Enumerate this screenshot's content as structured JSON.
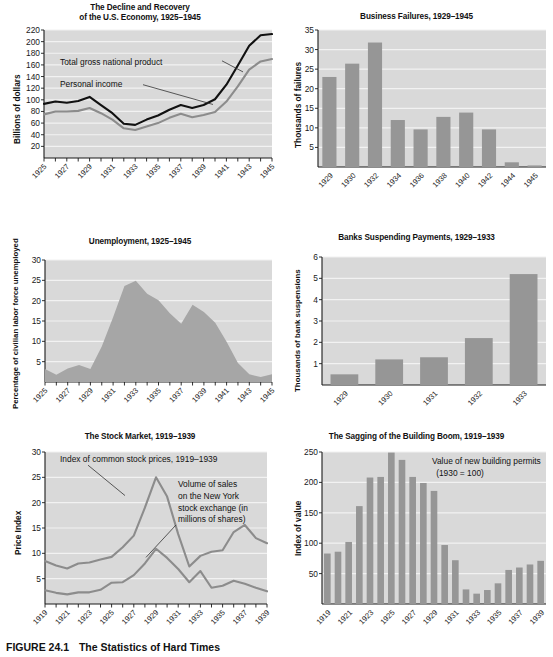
{
  "figure": {
    "caption_number": "FIGURE 24.1",
    "caption_title": "The Statistics of Hard Times"
  },
  "colors": {
    "plot_background": "#d9d9d9",
    "gridline": "#f2f2f2",
    "bar_fill": "#969696",
    "line_dark": "#111111",
    "line_gray": "#8c8c8c",
    "area_fill": "#a6a6a6",
    "axis": "#1a1a1a",
    "page_background": "#ffffff"
  },
  "chart_data": [
    {
      "id": "gnp",
      "type": "line",
      "title": "The Decline and Recovery\nof the U.S. Economy, 1925–1945",
      "title_lines": [
        "The Decline and Recovery",
        "of the U.S. Economy, 1925–1945"
      ],
      "xlabel": "",
      "ylabel": "Billions of dollars",
      "ylim": [
        0,
        220
      ],
      "yticks": [
        20,
        40,
        60,
        80,
        100,
        120,
        140,
        160,
        180,
        200,
        220
      ],
      "grid": true,
      "x": [
        1925,
        1926,
        1927,
        1928,
        1929,
        1930,
        1931,
        1932,
        1933,
        1934,
        1935,
        1936,
        1937,
        1938,
        1939,
        1940,
        1941,
        1942,
        1943,
        1944,
        1945
      ],
      "xticks": [
        1925,
        1927,
        1929,
        1931,
        1933,
        1935,
        1937,
        1939,
        1941,
        1943,
        1945
      ],
      "series": [
        {
          "name": "Total gross national product",
          "color": "#111111",
          "values": [
            93,
            97,
            95,
            98,
            105,
            91,
            77,
            59,
            57,
            66,
            73,
            83,
            91,
            86,
            91,
            101,
            126,
            159,
            193,
            211,
            213
          ]
        },
        {
          "name": "Personal income",
          "color": "#8c8c8c",
          "values": [
            75,
            80,
            80,
            81,
            86,
            77,
            66,
            51,
            48,
            54,
            60,
            69,
            76,
            70,
            74,
            79,
            97,
            123,
            152,
            166,
            170
          ]
        }
      ],
      "annotations": [
        {
          "text": "Total gross national product",
          "x": 1930.0,
          "y": 168
        },
        {
          "text": "Personal income",
          "x": 1930.0,
          "y": 130
        }
      ]
    },
    {
      "id": "business-failures",
      "type": "bar",
      "title": "Business Failures, 1929–1945",
      "title_lines": [
        "Business Failures, 1929–1945"
      ],
      "xlabel": "",
      "ylabel": "Thousands of failures",
      "ylim": [
        0,
        35
      ],
      "yticks": [
        5,
        10,
        15,
        20,
        25,
        30,
        35
      ],
      "grid": true,
      "categories": [
        "1929",
        "1930",
        "1932",
        "1934",
        "1936",
        "1938",
        "1940",
        "1942",
        "1944",
        "1945"
      ],
      "values": [
        23.0,
        26.4,
        31.8,
        12.0,
        9.6,
        12.8,
        13.9,
        9.6,
        1.2,
        0.4
      ]
    },
    {
      "id": "unemployment",
      "type": "area",
      "title": "Unemployment, 1925–1945",
      "title_lines": [
        "Unemployment, 1925–1945"
      ],
      "xlabel": "",
      "ylabel": "Percentage of civilian labor force unemployed",
      "ylim": [
        0,
        30
      ],
      "yticks": [
        5,
        10,
        15,
        20,
        25,
        30
      ],
      "grid": true,
      "x": [
        1925,
        1926,
        1927,
        1928,
        1929,
        1930,
        1931,
        1932,
        1933,
        1934,
        1935,
        1936,
        1937,
        1938,
        1939,
        1940,
        1941,
        1942,
        1943,
        1944,
        1945
      ],
      "xticks": [
        1925,
        1927,
        1929,
        1931,
        1933,
        1935,
        1937,
        1939,
        1941,
        1943,
        1945
      ],
      "values": [
        3.2,
        1.8,
        3.3,
        4.2,
        3.2,
        8.7,
        15.9,
        23.6,
        24.9,
        21.7,
        20.1,
        16.9,
        14.3,
        19.0,
        17.2,
        14.6,
        9.9,
        4.7,
        1.9,
        1.2,
        1.9
      ]
    },
    {
      "id": "bank-suspensions",
      "type": "bar",
      "title": "Banks Suspending Payments, 1929–1933",
      "title_lines": [
        "Banks Suspending Payments, 1929–1933"
      ],
      "xlabel": "",
      "ylabel": "Thousands of bank suspensions",
      "ylim": [
        0,
        6
      ],
      "yticks": [
        1,
        2,
        3,
        4,
        5,
        6
      ],
      "grid": true,
      "categories": [
        "1929",
        "1930",
        "1931",
        "1932",
        "1933"
      ],
      "values": [
        0.5,
        1.2,
        1.3,
        2.2,
        5.2
      ]
    },
    {
      "id": "stock-market",
      "type": "line",
      "title": "The Stock Market, 1919–1939",
      "title_lines": [
        "The Stock Market, 1919–1939"
      ],
      "xlabel": "",
      "ylabel": "Price Index",
      "ylim": [
        0,
        30
      ],
      "yticks": [
        5,
        10,
        15,
        20,
        25,
        30
      ],
      "grid": true,
      "x": [
        1919,
        1920,
        1921,
        1922,
        1923,
        1924,
        1925,
        1926,
        1927,
        1928,
        1929,
        1930,
        1931,
        1932,
        1933,
        1934,
        1935,
        1936,
        1937,
        1938,
        1939
      ],
      "xticks": [
        1919,
        1921,
        1923,
        1925,
        1927,
        1929,
        1931,
        1933,
        1935,
        1937,
        1939
      ],
      "series": [
        {
          "name": "Index of common stock prices, 1919–1939",
          "color": "#8c8c8c",
          "values": [
            8.5,
            7.6,
            7.0,
            8.0,
            8.2,
            8.8,
            9.3,
            11.2,
            13.5,
            19.0,
            25.0,
            21.2,
            13.8,
            7.4,
            9.5,
            10.3,
            10.6,
            14.2,
            15.6,
            13.0,
            12.0,
            12.2
          ]
        },
        {
          "name": "Volume of sales on the New York stock exchange (in millions of shares)",
          "color": "#8c8c8c",
          "values": [
            2.7,
            2.2,
            1.9,
            2.3,
            2.3,
            2.8,
            4.2,
            4.3,
            5.7,
            8.0,
            10.9,
            9.1,
            6.9,
            4.3,
            6.5,
            3.2,
            3.6,
            4.6,
            4.0,
            3.2,
            2.5
          ]
        }
      ],
      "annotations": [
        {
          "text": "Index of common stock prices, 1919–1939",
          "x": 1920.5,
          "y": 29
        },
        {
          "text": "Volume of sales",
          "x": 1929.0,
          "y": 23.2
        },
        {
          "text": "on the New York",
          "x": 1929.0,
          "y": 21.0
        },
        {
          "text": "stock exchange (in",
          "x": 1929.0,
          "y": 18.8
        },
        {
          "text": "millions of shares)",
          "x": 1929.0,
          "y": 16.6
        }
      ]
    },
    {
      "id": "building-boom",
      "type": "bar",
      "title": "The Sagging of the Building Boom, 1919–1939",
      "title_lines": [
        "The Sagging of the Building Boom, 1919–1939"
      ],
      "xlabel": "",
      "ylabel": "Index of value",
      "ylim": [
        0,
        250
      ],
      "yticks": [
        50,
        100,
        150,
        200,
        250
      ],
      "grid": true,
      "categories": [
        "1919",
        "1920",
        "1921",
        "1922",
        "1923",
        "1924",
        "1925",
        "1926",
        "1927",
        "1928",
        "1929",
        "1930",
        "1931",
        "1932",
        "1933",
        "1934",
        "1935",
        "1936",
        "1937",
        "1938",
        "1939"
      ],
      "xticks": [
        "1919",
        "1921",
        "1923",
        "1925",
        "1927",
        "1929",
        "1931",
        "1933",
        "1935",
        "1937",
        "1939"
      ],
      "values": [
        83,
        86,
        102,
        161,
        208,
        209,
        249,
        237,
        209,
        199,
        186,
        97,
        72,
        24,
        17,
        23,
        34,
        56,
        60,
        65,
        71
      ],
      "annotations": [
        {
          "text": "Value of new building permits",
          "x": 13.0,
          "y": 238
        },
        {
          "text": "(1930 = 100)",
          "x": 13.0,
          "y": 220
        }
      ]
    }
  ]
}
